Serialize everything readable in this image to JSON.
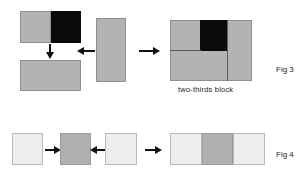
{
  "figure_sheet": {
    "background": "#ffffff",
    "palette": {
      "gray": "#b3b3b3",
      "gray_border": "#8f8f8f",
      "black": "#0a0a0a",
      "light": "#ededed",
      "light_border": "#b9b9b9",
      "mid": "#b0b0b0",
      "rule": "#5d5d5d",
      "arrow": "#111111",
      "text": "#1a1a1a"
    },
    "figures": [
      {
        "id": "fig3",
        "label": "Fig 3",
        "caption": "two-thirds block",
        "description": "two-thirds block assembly diagram",
        "elements": [
          {
            "name": "split-block-gray-half",
            "fill": "gray"
          },
          {
            "name": "split-block-black-half",
            "fill": "black"
          },
          {
            "name": "down-arrow",
            "direction": "down"
          },
          {
            "name": "solid-gray-block",
            "fill": "gray"
          },
          {
            "name": "vertical-gray-block",
            "fill": "gray"
          },
          {
            "name": "left-arrow",
            "direction": "left"
          },
          {
            "name": "right-arrow",
            "direction": "right"
          },
          {
            "name": "assembled-two-thirds-block",
            "fill": "gray"
          },
          {
            "name": "assembled-black-square",
            "fill": "black"
          }
        ]
      },
      {
        "id": "fig4",
        "label": "Fig 4",
        "caption": "",
        "description": "three-square assembly diagram",
        "elements": [
          {
            "name": "light-square-left",
            "fill": "light"
          },
          {
            "name": "right-arrow-1",
            "direction": "right"
          },
          {
            "name": "mid-gray-square",
            "fill": "mid"
          },
          {
            "name": "left-arrow-1",
            "direction": "left"
          },
          {
            "name": "light-square-right",
            "fill": "light"
          },
          {
            "name": "right-arrow-2",
            "direction": "right"
          },
          {
            "name": "assembled-row-light-left",
            "fill": "light"
          },
          {
            "name": "assembled-row-gray-center",
            "fill": "mid"
          },
          {
            "name": "assembled-row-light-right",
            "fill": "light"
          }
        ]
      }
    ]
  }
}
